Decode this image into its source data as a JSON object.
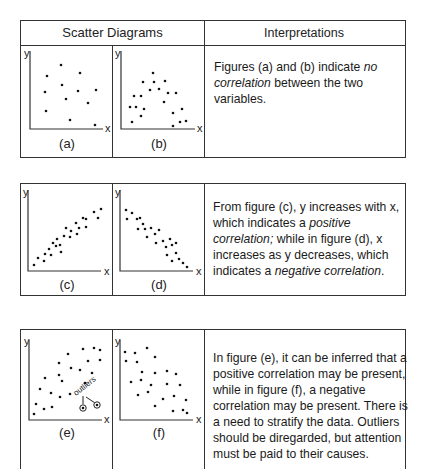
{
  "headers": {
    "scatter": "Scatter Diagrams",
    "interpretations": "Interpretations"
  },
  "axis": {
    "x": "x",
    "y": "y"
  },
  "rows": [
    {
      "figures": [
        {
          "caption": "(a)",
          "pattern": "no-correlation-random"
        },
        {
          "caption": "(b)",
          "pattern": "no-correlation-cluster"
        }
      ],
      "text": {
        "p1": "Figures (a) and (b) indicate ",
        "em1": "no",
        "br1": "correlation",
        "p2": " between the two variables."
      }
    },
    {
      "figures": [
        {
          "caption": "(c)",
          "pattern": "positive-correlation"
        },
        {
          "caption": "(d)",
          "pattern": "negative-correlation"
        }
      ],
      "text": {
        "p1": "From figure (c), y increases with x, which indicates a ",
        "em1": "positive correlation;",
        "p2": " while in figure (d), x increases as y decreases, which indicates a ",
        "em2": "negative correlation",
        "p3": "."
      }
    },
    {
      "figures": [
        {
          "caption": "(e)",
          "pattern": "possible-positive-with-outliers",
          "annotation": "outliers"
        },
        {
          "caption": "(f)",
          "pattern": "possible-negative"
        }
      ],
      "text": {
        "p1": "In figure (e), it can be inferred that a positive correlation may be present, while in figure (f), a negative correlation may be present.  There is a need to stratify the data. Outliers should be diregarded, but attention must be paid to their causes."
      }
    }
  ]
}
